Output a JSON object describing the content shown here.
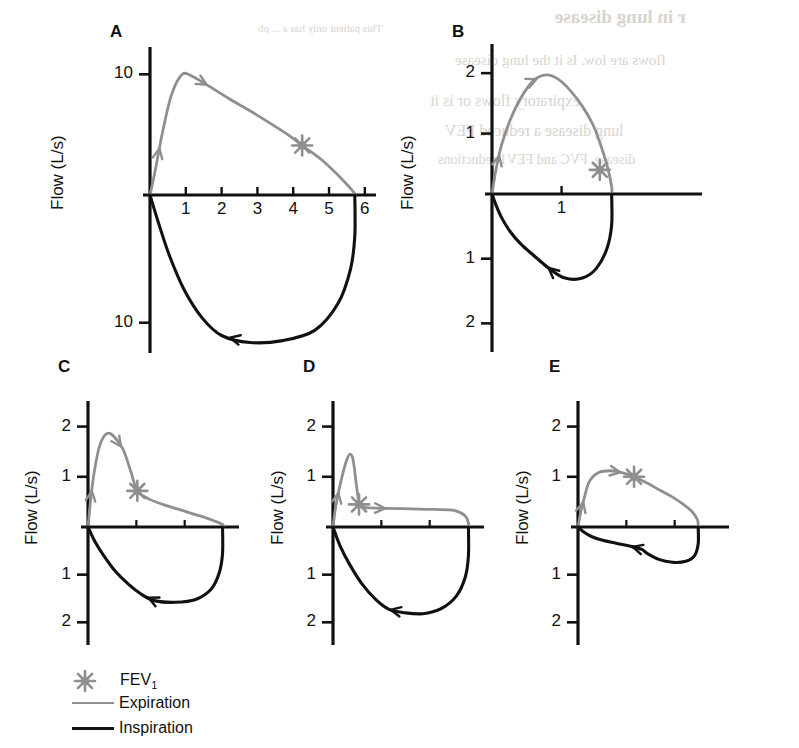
{
  "figure": {
    "axis_title": "Flow (L/s)",
    "colors": {
      "expiration": "#8f8f8f",
      "inspiration": "#111111",
      "axis": "#111111",
      "background": "#ffffff",
      "bleed_through": "#d8d4cf"
    }
  },
  "bleed_through_text": [
    "r in lung disease",
    "This patient only has a ... pb",
    "flows are low. Is it the lung disease",
    "expiratory flows or is it",
    "lung disease a reduced FEV",
    "disease, FVC and FEV1 reductions"
  ],
  "legend": {
    "items": [
      {
        "label": "FEV",
        "sub": "1",
        "marker": "asterisk-marker",
        "color": "#8f8f8f"
      },
      {
        "label": "Expiration",
        "sub": "",
        "marker": "line-swatch",
        "color": "#8f8f8f"
      },
      {
        "label": "Inspiration",
        "sub": "",
        "marker": "line-swatch",
        "color": "#111111"
      }
    ]
  },
  "panels": [
    {
      "id": "A",
      "label": "A",
      "condition": "normal",
      "axis_title": "Flow (L/s)",
      "y_ticks_up": [
        "10"
      ],
      "y_ticks_down": [
        "10"
      ],
      "x_ticks": [
        "1",
        "2",
        "3",
        "4",
        "5",
        "6"
      ],
      "x_ticks_unlabeled": 0,
      "fev1_marker": {
        "volume": 4.25,
        "flow": 4.1
      },
      "peak_expiratory_flow": 10.0,
      "fvc": 5.7,
      "peak_inspiratory_flow": 11.5
    },
    {
      "id": "B",
      "label": "B",
      "condition": "restrictive",
      "axis_title": "Flow (L/s)",
      "y_ticks_up": [
        "2",
        "1"
      ],
      "y_ticks_down": [
        "1",
        "2"
      ],
      "x_ticks": [
        "1"
      ],
      "x_ticks_unlabeled": 0,
      "fev1_marker": {
        "volume": 1.55,
        "flow": 0.4
      },
      "peak_expiratory_flow": 2.0,
      "fvc": 1.72,
      "peak_inspiratory_flow": 1.25
    },
    {
      "id": "C",
      "label": "C",
      "condition": "obstructive-mild",
      "axis_title": "Flow (L/s)",
      "y_ticks_up": [
        "2",
        "1"
      ],
      "y_ticks_down": [
        "1",
        "2"
      ],
      "x_ticks": [],
      "x_ticks_unlabeled": 2,
      "fev1_marker": {
        "volume": 1.1,
        "flow": 0.72
      },
      "peak_expiratory_flow": 1.9,
      "fvc": 3.0,
      "peak_inspiratory_flow": 1.5
    },
    {
      "id": "D",
      "label": "D",
      "condition": "obstructive-severe",
      "axis_title": "Flow (L/s)",
      "y_ticks_up": [
        "2",
        "1"
      ],
      "y_ticks_down": [
        "1",
        "2"
      ],
      "x_ticks": [],
      "x_ticks_unlabeled": 2,
      "fev1_marker": {
        "volume": 0.58,
        "flow": 0.45
      },
      "peak_expiratory_flow": 1.45,
      "fvc": 3.0,
      "peak_inspiratory_flow": 1.75
    },
    {
      "id": "E",
      "label": "E",
      "condition": "variable-extrathoracic-obstruction",
      "axis_title": "Flow (L/s)",
      "y_ticks_up": [
        "2",
        "1"
      ],
      "y_ticks_down": [
        "1",
        "2"
      ],
      "x_ticks": [],
      "x_ticks_unlabeled": 2,
      "fev1_marker": {
        "volume": 1.25,
        "flow": 1.0
      },
      "peak_expiratory_flow": 1.12,
      "fvc": 2.65,
      "peak_inspiratory_flow": 0.72
    }
  ],
  "chart_data": {
    "type": "line",
    "xlabel": "Volume (L)",
    "ylabel": "Flow (L/s)",
    "legend_position": "bottom-left",
    "grid": false,
    "panels": [
      {
        "id": "A",
        "name": "Normal flow-volume loop",
        "xlim": [
          0,
          6.2
        ],
        "ylim": [
          -11.9,
          11.6
        ],
        "y_tick_values_up": [
          10
        ],
        "y_tick_values_down": [
          10
        ],
        "x_tick_values": [
          1,
          2,
          3,
          4,
          5,
          6
        ],
        "annotations": [
          {
            "text": "FEV1",
            "marker": "asterisk",
            "x": 4.25,
            "y": 4.1
          },
          {
            "text": "expiration arrow up",
            "x": 0.33,
            "y": 6.0
          },
          {
            "text": "expiration arrow down-right",
            "x": 1.95,
            "y": 8.1
          },
          {
            "text": "inspiration arrow left",
            "x": 1.45,
            "y": -9.6
          }
        ],
        "series": [
          {
            "name": "Expiration",
            "color": "#8f8f8f",
            "x": [
              0.0,
              0.15,
              0.35,
              0.6,
              0.9,
              1.2,
              1.6,
              2.2,
              3.0,
              3.8,
              4.25,
              4.8,
              5.3,
              5.6,
              5.72,
              5.72
            ],
            "y": [
              0.0,
              2.1,
              5.2,
              8.3,
              10.0,
              9.8,
              9.1,
              8.0,
              6.6,
              5.1,
              4.1,
              2.9,
              1.5,
              0.55,
              0.1,
              0.0
            ]
          },
          {
            "name": "Inspiration",
            "color": "#111111",
            "x": [
              5.72,
              5.72,
              5.6,
              5.25,
              4.6,
              3.7,
              2.8,
              2.0,
              1.45,
              0.95,
              0.55,
              0.25,
              0.0
            ],
            "y": [
              0.0,
              -3.2,
              -5.8,
              -8.5,
              -10.6,
              -11.4,
              -11.55,
              -11.0,
              -9.6,
              -7.4,
              -4.8,
              -2.3,
              0.0
            ]
          }
        ]
      },
      {
        "id": "B",
        "name": "Restrictive lung disease loop",
        "xlim": [
          0,
          2.3
        ],
        "ylim": [
          -2.35,
          2.35
        ],
        "y_tick_values_up": [
          1,
          2
        ],
        "y_tick_values_down": [
          1,
          2
        ],
        "x_tick_values": [
          1
        ],
        "annotations": [
          {
            "text": "FEV1",
            "marker": "asterisk",
            "x": 1.55,
            "y": 0.4
          },
          {
            "text": "expiration arrow up",
            "x": 0.18,
            "y": 1.12
          },
          {
            "text": "expiration arrow down-right",
            "x": 1.12,
            "y": 1.55
          },
          {
            "text": "inspiration arrow left",
            "x": 0.58,
            "y": -0.95
          }
        ],
        "series": [
          {
            "name": "Expiration",
            "color": "#8f8f8f",
            "x": [
              0.0,
              0.06,
              0.14,
              0.26,
              0.42,
              0.6,
              0.78,
              0.95,
              1.12,
              1.3,
              1.45,
              1.56,
              1.66,
              1.72,
              1.72
            ],
            "y": [
              0.0,
              0.42,
              0.82,
              1.22,
              1.6,
              1.88,
              1.97,
              1.9,
              1.72,
              1.45,
              1.15,
              0.82,
              0.45,
              0.12,
              0.0
            ]
          },
          {
            "name": "Inspiration",
            "color": "#111111",
            "x": [
              1.72,
              1.72,
              1.65,
              1.5,
              1.3,
              1.05,
              0.82,
              0.6,
              0.42,
              0.26,
              0.13,
              0.05,
              0.0
            ],
            "y": [
              0.0,
              -0.48,
              -0.85,
              -1.15,
              -1.3,
              -1.3,
              -1.15,
              -0.95,
              -0.78,
              -0.58,
              -0.35,
              -0.15,
              0.0
            ]
          }
        ]
      },
      {
        "id": "C",
        "name": "Obstructive lung disease loop (concave expiration)",
        "xlim": [
          0,
          3.3
        ],
        "ylim": [
          -2.35,
          2.35
        ],
        "y_tick_values_up": [
          1,
          2
        ],
        "y_tick_values_down": [
          1,
          2
        ],
        "x_tick_values": [],
        "annotations": [
          {
            "text": "FEV1",
            "marker": "asterisk",
            "x": 1.1,
            "y": 0.72
          },
          {
            "text": "expiration arrow up",
            "x": 0.12,
            "y": 1.02
          },
          {
            "text": "expiration arrow down-right",
            "x": 0.66,
            "y": 1.42
          },
          {
            "text": "inspiration arrow left",
            "x": 1.22,
            "y": -1.43
          }
        ],
        "series": [
          {
            "name": "Expiration",
            "color": "#8f8f8f",
            "x": [
              0.0,
              0.06,
              0.14,
              0.26,
              0.42,
              0.58,
              0.78,
              0.95,
              1.1,
              1.35,
              1.7,
              2.1,
              2.5,
              2.82,
              3.0,
              3.0
            ],
            "y": [
              0.0,
              0.55,
              1.1,
              1.62,
              1.86,
              1.8,
              1.55,
              1.12,
              0.72,
              0.56,
              0.44,
              0.33,
              0.22,
              0.12,
              0.05,
              0.0
            ]
          },
          {
            "name": "Inspiration",
            "color": "#111111",
            "x": [
              3.0,
              3.0,
              2.93,
              2.75,
              2.4,
              1.95,
              1.5,
              1.22,
              0.9,
              0.6,
              0.35,
              0.15,
              0.0
            ],
            "y": [
              0.0,
              -0.55,
              -0.95,
              -1.3,
              -1.52,
              -1.58,
              -1.55,
              -1.43,
              -1.2,
              -0.92,
              -0.6,
              -0.3,
              0.0
            ]
          }
        ]
      },
      {
        "id": "D",
        "name": "Severe obstruction loop (early spike then plateau)",
        "xlim": [
          0,
          3.3
        ],
        "ylim": [
          -2.35,
          2.35
        ],
        "y_tick_values_up": [
          1,
          2
        ],
        "y_tick_values_down": [
          1,
          2
        ],
        "x_tick_values": [],
        "annotations": [
          {
            "text": "FEV1",
            "marker": "asterisk",
            "x": 0.58,
            "y": 0.45
          },
          {
            "text": "expiration arrow up",
            "x": 0.12,
            "y": 0.78
          },
          {
            "text": "expiration arrow right",
            "x": 1.75,
            "y": 0.36
          },
          {
            "text": "inspiration arrow left",
            "x": 1.25,
            "y": -1.73
          }
        ],
        "series": [
          {
            "name": "Expiration",
            "color": "#8f8f8f",
            "x": [
              0.0,
              0.05,
              0.12,
              0.2,
              0.3,
              0.38,
              0.45,
              0.52,
              0.58,
              0.68,
              0.85,
              1.2,
              1.75,
              2.25,
              2.7,
              2.95,
              3.02,
              3.02
            ],
            "y": [
              0.0,
              0.35,
              0.68,
              1.0,
              1.32,
              1.45,
              1.33,
              0.85,
              0.5,
              0.4,
              0.38,
              0.37,
              0.36,
              0.35,
              0.33,
              0.22,
              0.07,
              0.0
            ]
          },
          {
            "name": "Inspiration",
            "color": "#111111",
            "x": [
              3.02,
              3.02,
              2.95,
              2.75,
              2.4,
              2.0,
              1.6,
              1.25,
              0.95,
              0.65,
              0.38,
              0.16,
              0.0
            ],
            "y": [
              0.0,
              -0.6,
              -1.05,
              -1.45,
              -1.72,
              -1.82,
              -1.8,
              -1.73,
              -1.52,
              -1.2,
              -0.8,
              -0.4,
              0.0
            ]
          }
        ]
      },
      {
        "id": "E",
        "name": "Variable extrathoracic obstruction loop (flattened inspiration)",
        "xlim": [
          0,
          3.3
        ],
        "ylim": [
          -2.35,
          2.35
        ],
        "y_tick_values_up": [
          1,
          2
        ],
        "y_tick_values_down": [
          1,
          2
        ],
        "x_tick_values": [],
        "annotations": [
          {
            "text": "FEV1",
            "marker": "asterisk",
            "x": 1.25,
            "y": 1.0
          },
          {
            "text": "expiration arrow up",
            "x": 0.25,
            "y": 0.9
          },
          {
            "text": "expiration arrow down-right",
            "x": 1.85,
            "y": 0.72
          },
          {
            "text": "inspiration arrow left",
            "x": 1.42,
            "y": -0.47
          }
        ],
        "series": [
          {
            "name": "Expiration",
            "color": "#8f8f8f",
            "x": [
              0.0,
              0.06,
              0.14,
              0.25,
              0.45,
              0.72,
              1.0,
              1.25,
              1.55,
              1.85,
              2.1,
              2.35,
              2.55,
              2.66,
              2.68,
              2.68
            ],
            "y": [
              0.0,
              0.3,
              0.58,
              0.9,
              1.08,
              1.12,
              1.08,
              1.0,
              0.87,
              0.72,
              0.6,
              0.45,
              0.3,
              0.15,
              0.05,
              0.0
            ]
          },
          {
            "name": "Inspiration",
            "color": "#111111",
            "x": [
              2.68,
              2.68,
              2.6,
              2.4,
              2.1,
              1.8,
              1.55,
              1.42,
              1.15,
              0.85,
              0.55,
              0.3,
              0.12,
              0.0
            ],
            "y": [
              0.0,
              -0.35,
              -0.6,
              -0.72,
              -0.74,
              -0.68,
              -0.56,
              -0.47,
              -0.4,
              -0.34,
              -0.28,
              -0.2,
              -0.1,
              0.0
            ]
          }
        ]
      }
    ]
  }
}
